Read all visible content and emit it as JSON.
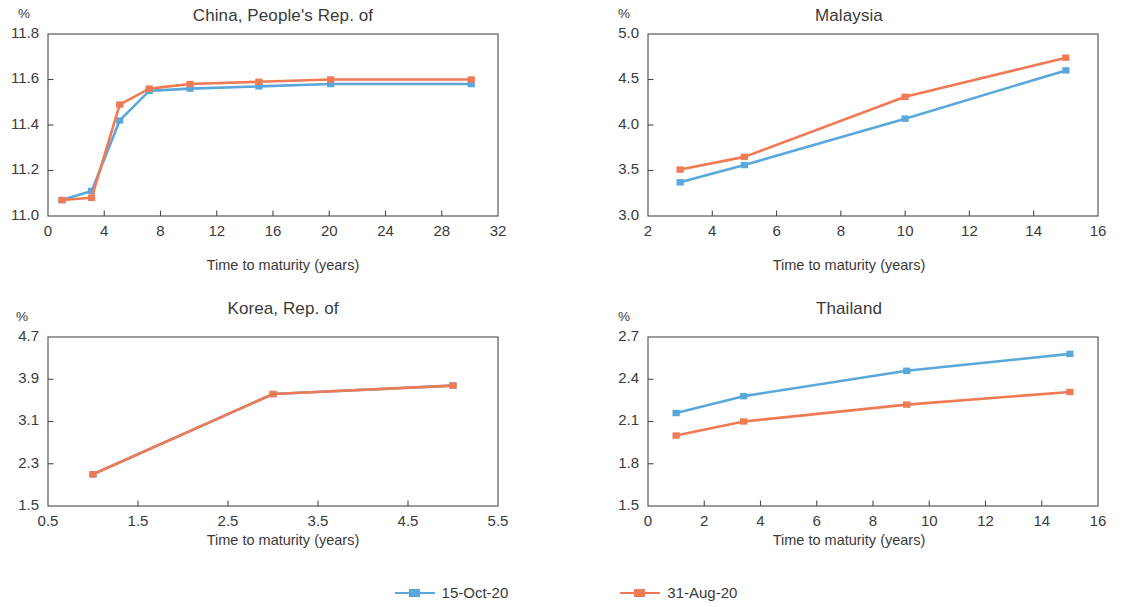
{
  "legend": {
    "position": "bottom-center",
    "entries": [
      {
        "label": "15-Oct-20",
        "color": "#5aa7db",
        "key": "oct"
      },
      {
        "label": "31-Aug-20",
        "color": "#ef7a54",
        "key": "aug"
      }
    ]
  },
  "common": {
    "xlabel": "Time to maturity (years)",
    "unit": "%"
  },
  "chart_data": [
    {
      "id": "china",
      "type": "line",
      "title": "China, People's Rep. of",
      "unit": "%",
      "xlabel": "Time to maturity (years)",
      "ylabel": "%",
      "xlim": [
        0,
        32
      ],
      "ylim": [
        11.0,
        11.8
      ],
      "xticks": [
        0,
        4,
        8,
        12,
        16,
        20,
        24,
        28,
        32
      ],
      "yticks": [
        11.0,
        11.2,
        11.4,
        11.6,
        11.8
      ],
      "ytick_labels": [
        "11.0",
        "11.2",
        "11.4",
        "11.6",
        "11.8"
      ],
      "xtick_labels": [
        "0",
        "4",
        "8",
        "12",
        "16",
        "20",
        "24",
        "28",
        "32"
      ],
      "grid": false,
      "series": [
        {
          "name": "15-Oct-20",
          "color": "#5aa7db",
          "x": [
            1.0,
            3.1,
            5.1,
            7.2,
            10.1,
            15.0,
            20.1,
            30.1
          ],
          "values": [
            11.07,
            11.11,
            11.42,
            11.55,
            11.56,
            11.57,
            11.58,
            11.58
          ]
        },
        {
          "name": "31-Aug-20",
          "color": "#ef7a54",
          "x": [
            1.0,
            3.1,
            5.1,
            7.2,
            10.1,
            15.0,
            20.1,
            30.1
          ],
          "values": [
            11.07,
            11.08,
            11.49,
            11.56,
            11.58,
            11.59,
            11.6,
            11.6
          ]
        }
      ]
    },
    {
      "id": "malaysia",
      "type": "line",
      "title": "Malaysia",
      "unit": "%",
      "xlabel": "Time to maturity (years)",
      "ylabel": "%",
      "xlim": [
        2,
        16
      ],
      "ylim": [
        3.0,
        5.0
      ],
      "xticks": [
        2,
        4,
        6,
        8,
        10,
        12,
        14,
        16
      ],
      "yticks": [
        3.0,
        3.5,
        4.0,
        4.5,
        5.0
      ],
      "ytick_labels": [
        "3.0",
        "3.5",
        "4.0",
        "4.5",
        "5.0"
      ],
      "xtick_labels": [
        "2",
        "4",
        "6",
        "8",
        "10",
        "12",
        "14",
        "16"
      ],
      "grid": false,
      "series": [
        {
          "name": "15-Oct-20",
          "color": "#5aa7db",
          "x": [
            3.0,
            5.0,
            10.0,
            15.0
          ],
          "values": [
            3.37,
            3.56,
            4.07,
            4.6
          ]
        },
        {
          "name": "31-Aug-20",
          "color": "#ef7a54",
          "x": [
            3.0,
            5.0,
            10.0,
            15.0
          ],
          "values": [
            3.51,
            3.65,
            4.31,
            4.74
          ]
        }
      ]
    },
    {
      "id": "korea",
      "type": "line",
      "title": "Korea, Rep. of",
      "unit": "%",
      "xlabel": "Time to maturity (years)",
      "ylabel": "%",
      "xlim": [
        0.5,
        5.5
      ],
      "ylim": [
        1.5,
        4.7
      ],
      "xticks": [
        0.5,
        1.5,
        2.5,
        3.5,
        4.5,
        5.5
      ],
      "yticks": [
        1.5,
        2.3,
        3.1,
        3.9,
        4.7
      ],
      "ytick_labels": [
        "1.5",
        "2.3",
        "3.1",
        "3.9",
        "4.7"
      ],
      "xtick_labels": [
        "0.5",
        "1.5",
        "2.5",
        "3.5",
        "4.5",
        "5.5"
      ],
      "grid": false,
      "note": "Both series coincide; blue is hidden beneath orange",
      "series": [
        {
          "name": "15-Oct-20",
          "color": "#5aa7db",
          "x": [
            1.0,
            3.0,
            5.0
          ],
          "values": [
            2.1,
            3.62,
            3.78
          ]
        },
        {
          "name": "31-Aug-20",
          "color": "#ef7a54",
          "x": [
            1.0,
            3.0,
            5.0
          ],
          "values": [
            2.1,
            3.62,
            3.78
          ]
        }
      ]
    },
    {
      "id": "thailand",
      "type": "line",
      "title": "Thailand",
      "unit": "%",
      "xlabel": "Time to maturity (years)",
      "ylabel": "%",
      "xlim": [
        0,
        16
      ],
      "ylim": [
        1.5,
        2.7
      ],
      "xticks": [
        0,
        2,
        4,
        6,
        8,
        10,
        12,
        14,
        16
      ],
      "yticks": [
        1.5,
        1.8,
        2.1,
        2.4,
        2.7
      ],
      "ytick_labels": [
        "1.5",
        "1.8",
        "2.1",
        "2.4",
        "2.7"
      ],
      "xtick_labels": [
        "0",
        "2",
        "4",
        "6",
        "8",
        "10",
        "12",
        "14",
        "16"
      ],
      "grid": false,
      "series": [
        {
          "name": "15-Oct-20",
          "color": "#5aa7db",
          "x": [
            1.0,
            3.4,
            9.2,
            15.0
          ],
          "values": [
            2.16,
            2.28,
            2.46,
            2.58
          ]
        },
        {
          "name": "31-Aug-20",
          "color": "#ef7a54",
          "x": [
            1.0,
            3.4,
            9.2,
            15.0
          ],
          "values": [
            2.0,
            2.1,
            2.22,
            2.31
          ]
        }
      ]
    }
  ]
}
